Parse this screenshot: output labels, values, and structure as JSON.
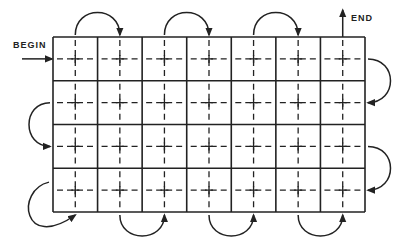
{
  "labels": {
    "begin": "BEGIN",
    "end": "END"
  },
  "grid": {
    "rows": 4,
    "cols": 7,
    "left": 53,
    "top": 37,
    "right": 365,
    "bottom": 212,
    "line_color": "#222222"
  },
  "path": {
    "description": "Serpentine traversal through cell centers; each cell has dashed crosshair",
    "top_arcs": [
      [
        1,
        2
      ],
      [
        3,
        4
      ],
      [
        5,
        6
      ]
    ],
    "right_arcs": [
      [
        1,
        2
      ],
      [
        3,
        4
      ]
    ],
    "left_arcs": [
      [
        2,
        3
      ]
    ],
    "bottom_arcs": [
      [
        2,
        3
      ],
      [
        4,
        5
      ],
      [
        6,
        7
      ]
    ],
    "bottom_left_loop": "row4-left-to-col1-bottom"
  }
}
